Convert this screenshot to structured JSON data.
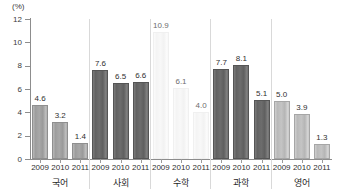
{
  "chart_data": {
    "type": "bar",
    "title": "",
    "subtitle": "",
    "xlabel": "",
    "ylabel": "",
    "unit_label": "(%)",
    "ylim": [
      0,
      12
    ],
    "y_ticks": [
      0,
      2,
      4,
      6,
      8,
      10,
      12
    ],
    "y_tick_labels": [
      "0",
      "2",
      "4",
      "6",
      "8",
      "10",
      "12"
    ],
    "grid": false,
    "legend": "none",
    "categories": [
      "2009",
      "2010",
      "2011"
    ],
    "groups": [
      {
        "name": "국어",
        "tone": "medium",
        "bars": [
          {
            "year": "2009",
            "value": 4.6,
            "label": "4.6"
          },
          {
            "year": "2010",
            "value": 3.2,
            "label": "3.2"
          },
          {
            "year": "2011",
            "value": 1.4,
            "label": "1.4"
          }
        ]
      },
      {
        "name": "사회",
        "tone": "dark",
        "bars": [
          {
            "year": "2009",
            "value": 7.6,
            "label": "7.6"
          },
          {
            "year": "2010",
            "value": 6.5,
            "label": "6.5"
          },
          {
            "year": "2011",
            "value": 6.6,
            "label": "6.6"
          }
        ]
      },
      {
        "name": "수학",
        "tone": "faded",
        "bars": [
          {
            "year": "2009",
            "value": 10.9,
            "label": "10.9"
          },
          {
            "year": "2010",
            "value": 6.1,
            "label": "6.1"
          },
          {
            "year": "2011",
            "value": 4.0,
            "label": "4.0"
          }
        ]
      },
      {
        "name": "과학",
        "tone": "dark",
        "bars": [
          {
            "year": "2009",
            "value": 7.7,
            "label": "7.7"
          },
          {
            "year": "2010",
            "value": 8.1,
            "label": "8.1"
          },
          {
            "year": "2011",
            "value": 5.1,
            "label": "5.1"
          }
        ]
      },
      {
        "name": "영어",
        "tone": "light",
        "bars": [
          {
            "year": "2009",
            "value": 5.0,
            "label": "5.0"
          },
          {
            "year": "2010",
            "value": 3.9,
            "label": "3.9"
          },
          {
            "year": "2011",
            "value": 1.3,
            "label": "1.3"
          }
        ]
      }
    ],
    "colors": {
      "medium": "#a3a3a3",
      "dark": "#666666",
      "faded": "#f7f7f7",
      "light": "#c2c2c2",
      "axis": "#8d8d8d",
      "separator": "#d9d9d9",
      "text": "#2f2f2f",
      "background": "#ffffff"
    }
  }
}
